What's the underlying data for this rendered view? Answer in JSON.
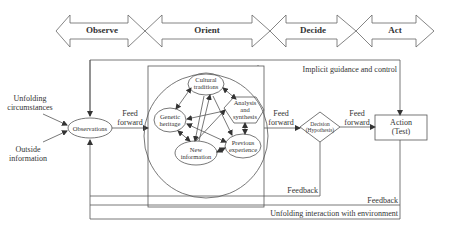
{
  "phases": [
    {
      "label": "Observe"
    },
    {
      "label": "Orient"
    },
    {
      "label": "Decide"
    },
    {
      "label": "Act"
    }
  ],
  "inputs": {
    "unfolding_circumstances": "Unfolding circumstances",
    "unfolding_line1": "Unfolding",
    "unfolding_line2": "circumstances",
    "outside_line1": "Outside",
    "outside_line2": "information"
  },
  "nodes": {
    "observations": "Observations",
    "cultural_line1": "Cultural",
    "cultural_line2": "traditions",
    "genetic_line1": "Genetic",
    "genetic_line2": "heritage",
    "analysis_line1": "Analysis",
    "analysis_line2": "and",
    "analysis_line3": "synthesis",
    "new_line1": "New",
    "new_line2": "information",
    "previous_line1": "Previous",
    "previous_line2": "experience",
    "decision_line1": "Decision",
    "decision_line2": "(Hypothesis)",
    "action_line1": "Action",
    "action_line2": "(Test)"
  },
  "edges": {
    "feed_forward_1_line1": "Feed",
    "feed_forward_1_line2": "forward",
    "feed_forward_2_line1": "Feed",
    "feed_forward_2_line2": "forward",
    "feed_forward_3_line1": "Feed",
    "feed_forward_3_line2": "forward",
    "implicit_guidance": "Implicit guidance and control",
    "feedback_1": "Feedback",
    "feedback_2": "Feedback",
    "unfolding_interaction": "Unfolding interaction with environment"
  },
  "colors": {
    "stroke": "#555555",
    "text": "#333333",
    "background": "#ffffff"
  }
}
